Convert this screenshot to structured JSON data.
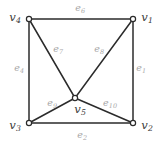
{
  "figure": {
    "background_color": "#ffffff",
    "edge_color": "#2b2b2b",
    "vertex_stroke_color": "#2b2b2b",
    "vertex_fill_color": "#ffffff",
    "vertex_label_color": "#3a3a3a",
    "edge_label_color": "#a8a8a8",
    "width": 163,
    "height": 145
  },
  "graph_data": {
    "type": "diagram",
    "layout": "square-with-center",
    "vertices": [
      {
        "id": "v1",
        "name": "v",
        "sub": "1",
        "x": 133,
        "y": 19,
        "label_x": 147,
        "label_y": 18
      },
      {
        "id": "v2",
        "name": "v",
        "sub": "2",
        "x": 133,
        "y": 123,
        "label_x": 147,
        "label_y": 126
      },
      {
        "id": "v3",
        "name": "v",
        "sub": "3",
        "x": 29,
        "y": 123,
        "label_x": 15,
        "label_y": 126
      },
      {
        "id": "v4",
        "name": "v",
        "sub": "4",
        "x": 29,
        "y": 19,
        "label_x": 15,
        "label_y": 18
      },
      {
        "id": "v5",
        "name": "v",
        "sub": "5",
        "x": 75,
        "y": 98,
        "label_x": 80,
        "label_y": 110
      }
    ],
    "edges": [
      {
        "id": "e1",
        "name": "e",
        "sub": "1",
        "from": "v1",
        "to": "v2",
        "label_x": 141,
        "label_y": 68
      },
      {
        "id": "e2",
        "name": "e",
        "sub": "2",
        "from": "v3",
        "to": "v2",
        "label_x": 82,
        "label_y": 135
      },
      {
        "id": "e4",
        "name": "e",
        "sub": "4",
        "from": "v4",
        "to": "v3",
        "label_x": 19,
        "label_y": 68
      },
      {
        "id": "e6",
        "name": "e",
        "sub": "6",
        "from": "v4",
        "to": "v1",
        "label_x": 80,
        "label_y": 8
      },
      {
        "id": "e7",
        "name": "e",
        "sub": "7",
        "from": "v4",
        "to": "v5",
        "label_x": 58,
        "label_y": 49
      },
      {
        "id": "e8",
        "name": "e",
        "sub": "8",
        "from": "v1",
        "to": "v5",
        "label_x": 99,
        "label_y": 49
      },
      {
        "id": "e9",
        "name": "e",
        "sub": "9",
        "from": "v3",
        "to": "v5",
        "label_x": 52,
        "label_y": 103
      },
      {
        "id": "e10",
        "name": "e",
        "sub": "10",
        "from": "v2",
        "to": "v5",
        "label_x": 110,
        "label_y": 103
      }
    ]
  }
}
